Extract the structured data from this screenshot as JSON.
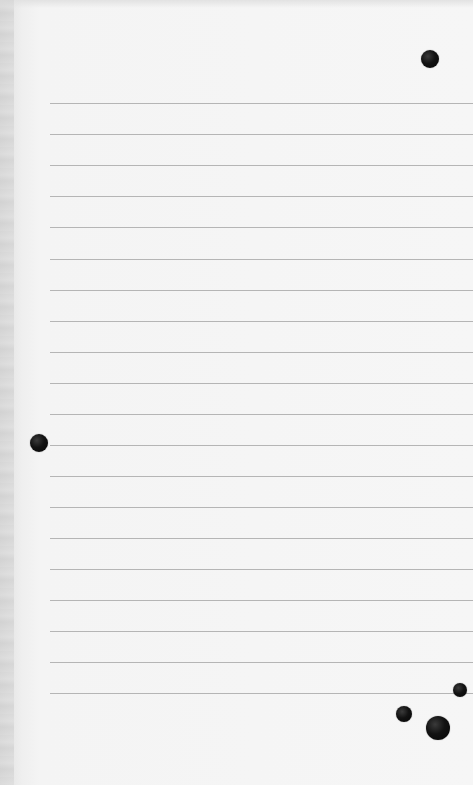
{
  "sheet": {
    "background": "#f6f6f6",
    "rule_color": "#a9a9a9",
    "rule_left": 50,
    "rules_y": [
      103,
      134,
      165,
      196,
      227,
      259,
      290,
      321,
      352,
      383,
      414,
      445,
      476,
      507,
      538,
      569,
      600,
      631,
      662,
      693
    ]
  },
  "dots": [
    {
      "x": 430,
      "y": 59,
      "r": 9
    },
    {
      "x": 39,
      "y": 443,
      "r": 9
    },
    {
      "x": 460,
      "y": 690,
      "r": 7
    },
    {
      "x": 404,
      "y": 714,
      "r": 8
    },
    {
      "x": 438,
      "y": 728,
      "r": 12
    }
  ]
}
